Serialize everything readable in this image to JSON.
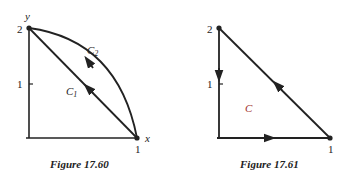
{
  "figures": [
    {
      "caption": "Figure 17.60",
      "axes": {
        "x_label": "x",
        "y_label": "y"
      },
      "ticks": {
        "y2": "2",
        "y1": "1",
        "x1": "1"
      },
      "curves": [
        {
          "label": "C",
          "subscript": "1",
          "type": "line",
          "from": [
            1,
            0
          ],
          "to": [
            0,
            2
          ],
          "direction": "toward (0,2)"
        },
        {
          "label": "C",
          "subscript": "2",
          "type": "arc",
          "from": [
            1,
            0
          ],
          "to": [
            0,
            2
          ],
          "direction": "toward (0,2)"
        }
      ],
      "points": [
        [
          0,
          2
        ],
        [
          1,
          0
        ]
      ]
    },
    {
      "caption": "Figure 17.61",
      "ticks": {
        "y2": "2",
        "y1": "1",
        "x1": "1"
      },
      "region_label": "C",
      "region_label_color": "#a0302a",
      "curves": [
        {
          "type": "segment",
          "from": [
            0,
            2
          ],
          "to": [
            0,
            0
          ],
          "direction": "down"
        },
        {
          "type": "segment",
          "from": [
            0,
            0
          ],
          "to": [
            1,
            0
          ],
          "direction": "right"
        },
        {
          "type": "segment",
          "from": [
            1,
            0
          ],
          "to": [
            0,
            2
          ],
          "direction": "toward (0,2)"
        }
      ],
      "points": [
        [
          0,
          2
        ],
        [
          1,
          0
        ]
      ]
    }
  ],
  "colors": {
    "stroke": "#222222",
    "background": "#ffffff",
    "region_label": "#a0302a"
  }
}
